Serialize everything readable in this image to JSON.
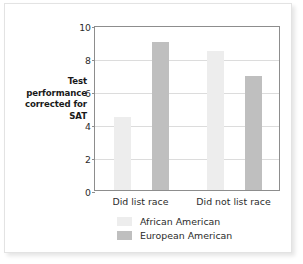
{
  "chart_data": {
    "type": "bar",
    "title": "",
    "xlabel": "",
    "ylabel": "Test performance corrected for SAT",
    "ylim": [
      0,
      10
    ],
    "yticks": [
      0,
      2,
      4,
      6,
      8,
      10
    ],
    "ytick_labels": [
      "0",
      "2",
      "4",
      "6",
      "8",
      "10"
    ],
    "grid": true,
    "legend_position": "bottom",
    "categories": [
      "Did list race",
      "Did not list race"
    ],
    "series": [
      {
        "name": "African American",
        "color": "#ededed",
        "values": [
          4.4,
          8.4
        ]
      },
      {
        "name": "European American",
        "color": "#bfbfbf",
        "values": [
          9.0,
          6.9
        ]
      }
    ]
  },
  "figure": {
    "background_color": "#ffffff",
    "border_color": "#e3e3e3",
    "axis_color": "#8d8d8d",
    "gridline_color": "#dcdcdc",
    "text_color": "#2b2b2b"
  }
}
